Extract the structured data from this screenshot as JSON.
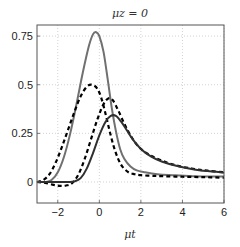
{
  "chart_data": {
    "type": "line",
    "title": "μz = 0",
    "xlabel": "μt",
    "ylabel": "",
    "xlim": [
      -3,
      6
    ],
    "ylim": [
      -0.108,
      0.807
    ],
    "grid": true,
    "legend": null,
    "xticks": [
      -2,
      0,
      2,
      4,
      6
    ],
    "xtick_labels": [
      "−2",
      "0",
      "2",
      "4",
      "6"
    ],
    "yticks": [
      0,
      0.25,
      0.5,
      0.75
    ],
    "ytick_labels": [
      "0",
      "0.25",
      "0.5",
      "0.75"
    ],
    "series": [
      {
        "name": "gray-solid",
        "style": "solid",
        "color": "#707070",
        "x": [
          -3,
          -2.6,
          -2.3,
          -2.0,
          -1.7,
          -1.4,
          -1.1,
          -0.8,
          -0.5,
          -0.3,
          -0.15,
          0.0,
          0.2,
          0.4,
          0.6,
          0.8,
          1.0,
          1.2,
          1.5,
          1.8,
          2.2,
          2.8,
          3.5,
          4.5,
          6.0
        ],
        "y": [
          0.0,
          0.0,
          0.01,
          0.05,
          0.13,
          0.25,
          0.4,
          0.56,
          0.7,
          0.76,
          0.77,
          0.75,
          0.67,
          0.53,
          0.38,
          0.26,
          0.17,
          0.12,
          0.08,
          0.06,
          0.05,
          0.04,
          0.035,
          0.03,
          0.028
        ]
      },
      {
        "name": "dashed-1",
        "style": "dashed",
        "color": "#000000",
        "x": [
          -3,
          -2.7,
          -2.4,
          -2.1,
          -1.8,
          -1.5,
          -1.2,
          -0.9,
          -0.6,
          -0.35,
          -0.1,
          0.1,
          0.3,
          0.5,
          0.7,
          0.9,
          1.1,
          1.4,
          1.7,
          2.0,
          2.5,
          3.0,
          4.0,
          5.0,
          6.0
        ],
        "y": [
          0.0,
          0.01,
          0.04,
          0.1,
          0.18,
          0.27,
          0.36,
          0.44,
          0.49,
          0.5,
          0.48,
          0.43,
          0.35,
          0.26,
          0.18,
          0.12,
          0.08,
          0.05,
          0.04,
          0.035,
          0.032,
          0.03,
          0.027,
          0.025,
          0.022
        ]
      },
      {
        "name": "dashed-2",
        "style": "dashed",
        "color": "#000000",
        "x": [
          -3,
          -2.6,
          -2.2,
          -1.9,
          -1.6,
          -1.3,
          -1.0,
          -0.7,
          -0.4,
          -0.1,
          0.2,
          0.45,
          0.65,
          0.9,
          1.2,
          1.5,
          1.9,
          2.4,
          3.0,
          3.7,
          4.5,
          5.2,
          6.0
        ],
        "y": [
          0.0,
          -0.005,
          -0.015,
          -0.02,
          -0.018,
          -0.005,
          0.04,
          0.12,
          0.22,
          0.32,
          0.4,
          0.43,
          0.42,
          0.37,
          0.3,
          0.24,
          0.18,
          0.14,
          0.11,
          0.085,
          0.068,
          0.058,
          0.05
        ]
      },
      {
        "name": "dark-solid",
        "style": "solid",
        "color": "#303030",
        "x": [
          -3,
          -2.5,
          -2.0,
          -1.5,
          -1.2,
          -0.9,
          -0.6,
          -0.3,
          0.0,
          0.3,
          0.55,
          0.8,
          1.05,
          1.3,
          1.6,
          2.0,
          2.5,
          3.0,
          3.7,
          4.5,
          5.2,
          6.0
        ],
        "y": [
          0.0,
          0.0,
          0.0,
          0.0,
          0.003,
          0.02,
          0.07,
          0.15,
          0.24,
          0.31,
          0.34,
          0.34,
          0.31,
          0.27,
          0.22,
          0.17,
          0.13,
          0.105,
          0.083,
          0.066,
          0.056,
          0.048
        ]
      }
    ]
  }
}
